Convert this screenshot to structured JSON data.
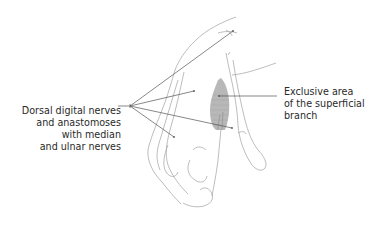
{
  "figure": {
    "labels": {
      "left": {
        "lines": [
          "Dorsal digital nerves",
          "and anastomoses",
          "with median",
          "and ulnar nerves"
        ],
        "leader_count": 5
      },
      "right": {
        "lines": [
          "Exclusive area",
          "of the superficial",
          "branch"
        ],
        "leader_count": 1
      }
    },
    "colors": {
      "outline": "#9a9a9a",
      "leader": "#555555",
      "shaded_area": "#b5b5b5",
      "text": "#2a2a2a"
    }
  }
}
